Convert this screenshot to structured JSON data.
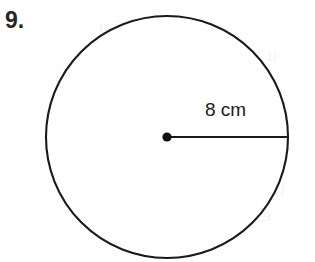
{
  "page": {
    "background_color": "#fefefe",
    "width": 315,
    "height": 262
  },
  "problem": {
    "number_label": "9."
  },
  "figure": {
    "shape": "circle",
    "stroke_color": "#1a1a1a",
    "fill_color": "#ffffff",
    "center_dot_color": "#111111",
    "radius_line_color": "#1a1a1a",
    "center_x": 167,
    "center_y": 137,
    "radius_px": 121,
    "radius_label": "8 cm",
    "radius_value": 8,
    "radius_units": "cm",
    "radius_line_from": "center",
    "radius_line_to": "right-edge"
  },
  "ghost_text": {
    "line1": "u p c a",
    "line2": "e t i o n",
    "line3": "r e a",
    "line4": "d i a m",
    "line5": "t h e",
    "line6": "e r c l e",
    "line7": "r a d i u"
  }
}
